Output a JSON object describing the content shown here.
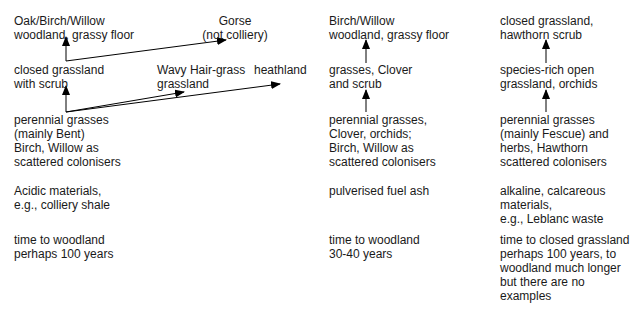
{
  "columns": [
    {
      "id": "acidic",
      "stages": {
        "top": "Oak/Birch/Willow\nwoodland, grassy floor",
        "middle": "closed grassland\nwith scrub",
        "bottom": "perennial grasses\n(mainly Bent)\nBirch, Willow as\nscattered colonisers"
      },
      "branches": {
        "gorse": "Gorse\n(not colliery)",
        "wavy_hair_grass": "Wavy Hair-grass\ngrassland",
        "heathland": "heathland"
      },
      "substrate": "Acidic materials,\ne.g., colliery shale",
      "time": "time to woodland\nperhaps 100 years"
    },
    {
      "id": "fuel-ash",
      "stages": {
        "top": "Birch/Willow\nwoodland, grassy floor",
        "middle": "grasses, Clover\nand scrub",
        "bottom": "perennial grasses,\nClover, orchids;\nBirch, Willow as\nscattered colonisers"
      },
      "substrate": "pulverised fuel ash",
      "time": "time to woodland\n30-40 years"
    },
    {
      "id": "alkaline",
      "stages": {
        "top": "closed grassland,\nhawthorn scrub",
        "middle": "species-rich open\ngrassland, orchids",
        "bottom": "perennial grasses\n(mainly Fescue) and\nherbs, Hawthorn\nscattered colonisers"
      },
      "substrate": "alkaline, calcareous\nmaterials,\ne.g., Leblanc waste",
      "time": "time to closed grassland\nperhaps 100 years, to\nwoodland much longer\nbut there are no\nexamples"
    }
  ],
  "colors": {
    "text": "#1a1a1a",
    "arrow": "#000000",
    "background": "#ffffff"
  }
}
